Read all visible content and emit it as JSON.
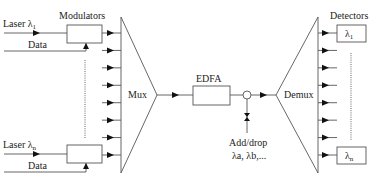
{
  "diagram": {
    "modulators_label": "Modulators",
    "detectors_label": "Detectors",
    "mux_label": "Mux",
    "demux_label": "Demux",
    "edfa_label": "EDFA",
    "add_drop_label": "Add/drop",
    "add_drop_channels": "λa, λb,...",
    "inputs": [
      {
        "laser_label": "Laser λ",
        "laser_sub": "1",
        "data_label": "Data"
      },
      {
        "laser_label": "Laser λ",
        "laser_sub": "n",
        "data_label": "Data"
      }
    ],
    "detector_boxes": [
      {
        "label": "λ",
        "sub": "1"
      },
      {
        "label": "λ",
        "sub": "n"
      }
    ],
    "mux_input_count": 8,
    "demux_output_count": 8
  }
}
